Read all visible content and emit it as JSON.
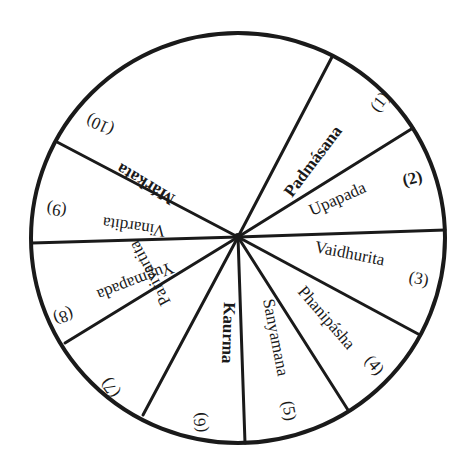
{
  "diagram": {
    "type": "wheel",
    "center": [
      238,
      237
    ],
    "radius": 206,
    "stroke_color": "#1a1a1a",
    "background": "#ffffff",
    "spoke_endpoints": [
      [
        332,
        57
      ],
      [
        413,
        128
      ],
      [
        445,
        230
      ],
      [
        420,
        335
      ],
      [
        348,
        410
      ],
      [
        245,
        443
      ],
      [
        143,
        415
      ],
      [
        65,
        343
      ],
      [
        32,
        243
      ],
      [
        57,
        142
      ]
    ],
    "segments": [
      {
        "index": 1,
        "name": "Padmásana",
        "number": "(1)",
        "bold": true
      },
      {
        "index": 2,
        "name": "Upapada",
        "number": "(2)",
        "bold": false
      },
      {
        "index": 3,
        "name": "Vaidhurita",
        "number": "(3)",
        "bold": false
      },
      {
        "index": 4,
        "name": "Phanipásha",
        "number": "(4)",
        "bold": false
      },
      {
        "index": 5,
        "name": "Sanyamana",
        "number": "(5)",
        "bold": false
      },
      {
        "index": 6,
        "name": "Kaurma",
        "number": "(6)",
        "bold": true
      },
      {
        "index": 7,
        "name": "Parivartita",
        "number": "(7)",
        "bold": false
      },
      {
        "index": 8,
        "name": "Yugmapada",
        "number": "(8)",
        "bold": false
      },
      {
        "index": 9,
        "name": "Vinardita",
        "number": "(9)",
        "bold": false
      },
      {
        "index": 10,
        "name": "Márkata",
        "number": "(10)",
        "bold": true
      }
    ]
  }
}
